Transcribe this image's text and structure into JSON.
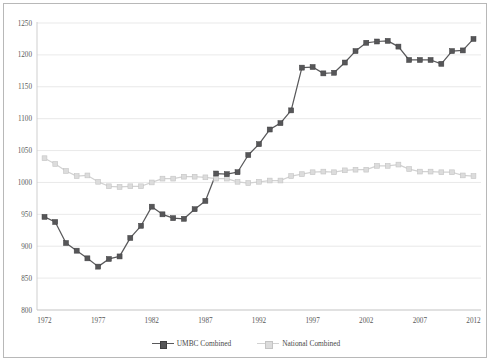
{
  "chart_data": {
    "type": "line",
    "title": "",
    "xlabel": "",
    "ylabel": "",
    "grid": true,
    "legend_position": "bottom",
    "x": [
      1972,
      1973,
      1974,
      1975,
      1976,
      1977,
      1978,
      1979,
      1980,
      1981,
      1982,
      1983,
      1984,
      1985,
      1986,
      1987,
      1988,
      1989,
      1990,
      1991,
      1992,
      1993,
      1994,
      1995,
      1996,
      1997,
      1998,
      1999,
      2000,
      2001,
      2002,
      2003,
      2004,
      2005,
      2006,
      2007,
      2008,
      2009,
      2010,
      2011,
      2012
    ],
    "xlim": [
      1971.3,
      2012.7
    ],
    "ylim": [
      800,
      1250
    ],
    "yticks": [
      800,
      850,
      900,
      950,
      1000,
      1050,
      1100,
      1150,
      1200,
      1250
    ],
    "ytick_labels": [
      "800",
      "850",
      "900",
      "950",
      "1000",
      "1050",
      "1100",
      "1150",
      "1200",
      "1250"
    ],
    "xticks": [
      1972,
      1977,
      1982,
      1987,
      1992,
      1997,
      2002,
      2007,
      2012
    ],
    "xtick_labels": [
      "1972",
      "1977",
      "1982",
      "1987",
      "1992",
      "1997",
      "2002",
      "2007",
      "2012"
    ],
    "series": [
      {
        "name": "UMBC Combined",
        "color": "#565658",
        "marker": "square",
        "values": [
          946,
          938,
          905,
          893,
          881,
          868,
          880,
          884,
          913,
          932,
          962,
          950,
          944,
          943,
          958,
          971,
          1014,
          1013,
          1016,
          1043,
          1060,
          1083,
          1093,
          1113,
          1180,
          1181,
          1171,
          1172,
          1188,
          1206,
          1219,
          1221,
          1222,
          1213,
          1192,
          1192,
          1192,
          1186,
          1206,
          1207,
          1225
        ]
      },
      {
        "name": "National Combined",
        "color": "#dcdcdc",
        "marker": "square",
        "values": [
          1038,
          1029,
          1018,
          1010,
          1011,
          1001,
          994,
          993,
          994,
          994,
          1000,
          1006,
          1006,
          1009,
          1009,
          1008,
          1006,
          1006,
          1001,
          999,
          1001,
          1003,
          1003,
          1010,
          1013,
          1016,
          1017,
          1016,
          1019,
          1020,
          1020,
          1026,
          1026,
          1028,
          1021,
          1017,
          1017,
          1016,
          1016,
          1011,
          1010
        ]
      }
    ]
  },
  "legend": {
    "items": [
      {
        "label": "UMBC Combined"
      },
      {
        "label": "National Combined"
      }
    ]
  }
}
